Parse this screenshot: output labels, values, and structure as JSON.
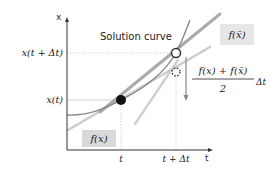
{
  "diagram": {
    "title": "Solution curve",
    "axes": {
      "x_axis_label": "t",
      "y_axis_label": "x",
      "x_ticks": [
        "t",
        "t + Δt"
      ],
      "y_ticks": [
        "x(t)",
        "x(t + Δt)"
      ]
    },
    "labels": {
      "slope_start": "f(x)",
      "slope_end": "f(x̄)",
      "fraction_numerator": "f(x) + f(x̄)",
      "fraction_denominator": "2",
      "fraction_suffix": "Δt"
    },
    "points": {
      "start": "filled-point",
      "exact_end": "open-point",
      "predicted_end": "dashed-point"
    },
    "colors": {
      "axis": "#333333",
      "solution_curve": "#888888",
      "tangent_line": "#aaaaaa",
      "tangent_light": "#cccccc",
      "guide": "#c8c8c8",
      "label_box": "#d9d9d9",
      "point": "#111111"
    }
  }
}
